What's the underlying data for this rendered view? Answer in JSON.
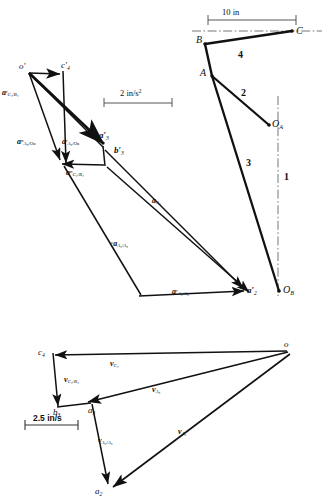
{
  "figure": {
    "stroke_color": "#111111",
    "chain_color": "#555555"
  },
  "mechanism": {
    "name": "linkage-diagram",
    "scale_label": "10 in",
    "points": [
      {
        "id": "B",
        "label": "B",
        "x": 206,
        "y": 43
      },
      {
        "id": "C",
        "label": "C",
        "x": 292,
        "y": 33
      },
      {
        "id": "A",
        "label": "A",
        "x": 213,
        "y": 75
      },
      {
        "id": "OA",
        "label": "O",
        "sub": "A",
        "x": 268,
        "y": 124
      },
      {
        "id": "OB",
        "label": "O",
        "sub": "B",
        "x": 279,
        "y": 290
      }
    ],
    "links": [
      {
        "id": "1",
        "label": "1"
      },
      {
        "id": "2",
        "label": "2"
      },
      {
        "id": "3",
        "label": "3"
      },
      {
        "id": "4",
        "label": "4"
      }
    ]
  },
  "acceleration_polygon": {
    "name": "acceleration-polygon",
    "scale_label": "2 in/s",
    "scale_exponent": "2",
    "points": [
      {
        "id": "op",
        "label": "o",
        "prime": "′"
      },
      {
        "id": "c4p",
        "label": "c",
        "prime": "′",
        "sub": "4"
      },
      {
        "id": "a3p",
        "label": "a",
        "prime": "′",
        "sub": "3"
      },
      {
        "id": "b3p",
        "label": "b",
        "prime": "′",
        "sub": "3"
      },
      {
        "id": "a2p",
        "label": "a",
        "prime": "′",
        "sub": "2"
      }
    ],
    "vectors": [
      {
        "id": "at_C4B4",
        "base": "a",
        "sup": "t",
        "sub": "C₄/B₄"
      },
      {
        "id": "an_A3OB",
        "base": "a",
        "sup": "n",
        "sub": "A₃/Oʙ"
      },
      {
        "id": "at_A3OB",
        "base": "a",
        "sup": "t",
        "sub": "A₃/Oʙ"
      },
      {
        "id": "an_C4B4",
        "base": "a",
        "sup": "n",
        "sub": "C₄/B₄"
      },
      {
        "id": "a_A2",
        "base": "a",
        "sup": "",
        "sub": "A₂"
      },
      {
        "id": "ac_A2A3",
        "base": "a",
        "sup": "c",
        "sub": "A₂/A₃"
      },
      {
        "id": "ar_A2A3",
        "base": "a",
        "sup": "r",
        "sub": "A₂/A₃"
      }
    ]
  },
  "velocity_polygon": {
    "name": "velocity-polygon",
    "scale_label": "2.5 in/s",
    "points": [
      {
        "id": "o",
        "label": "o"
      },
      {
        "id": "c4",
        "label": "c",
        "sub": "4"
      },
      {
        "id": "b3",
        "label": "b",
        "sub": "3"
      },
      {
        "id": "a3",
        "label": "a",
        "sub": "3"
      },
      {
        "id": "a2",
        "label": "a",
        "sub": "2"
      }
    ],
    "vectors": [
      {
        "id": "v_C4",
        "base": "v",
        "sub": "C₄"
      },
      {
        "id": "v_C4B4",
        "base": "v",
        "sub": "C₄/B₄"
      },
      {
        "id": "v_A3",
        "base": "v",
        "sub": "A₃"
      },
      {
        "id": "v_A2A3",
        "base": "v",
        "sub": "A₂/A₃"
      },
      {
        "id": "v_A2",
        "base": "v",
        "sub": "A₂"
      }
    ]
  },
  "labels": {
    "B": "B",
    "C": "C",
    "A": "A",
    "O": "O",
    "subA": "A",
    "subB": "B",
    "link1": "1",
    "link2": "2",
    "link3": "3",
    "link4": "4",
    "scale_mech": "10 in",
    "scale_acc": "2 in/s",
    "scale_acc_exp": "2",
    "scale_vel": "2.5 in/s",
    "o_prime": "o′",
    "c4_prime": "c′",
    "a3_prime": "a′",
    "b3_prime": "b′",
    "a2_prime": "a′",
    "sub4": "4",
    "sub3": "3",
    "sub2": "2",
    "a": "a",
    "v": "v",
    "sup_t": "t",
    "sup_n": "n",
    "sup_c": "c",
    "sup_r": "r",
    "sub_C4B4": "C₄/B₄",
    "sub_A3OB": "A₃/Oʙ",
    "sub_A2": "A₂",
    "sub_A3": "A₃",
    "sub_A2A3": "A₂/A₃",
    "sub_C4": "C₄",
    "o": "o",
    "c": "c",
    "b": "b"
  }
}
